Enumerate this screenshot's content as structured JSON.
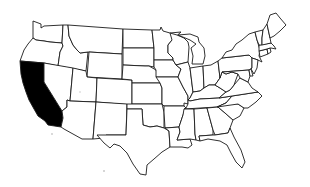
{
  "map": {
    "title": "United States",
    "highlighted_state": "California",
    "highlight_color": "#000000",
    "fill_color": "#ffffff",
    "stroke_color": "#1a1a1a",
    "states": [
      {
        "name": "Washington",
        "highlighted": false
      },
      {
        "name": "Oregon",
        "highlighted": false
      },
      {
        "name": "California",
        "highlighted": true
      },
      {
        "name": "Idaho",
        "highlighted": false
      },
      {
        "name": "Nevada",
        "highlighted": false
      },
      {
        "name": "Montana",
        "highlighted": false
      },
      {
        "name": "Wyoming",
        "highlighted": false
      },
      {
        "name": "Utah",
        "highlighted": false
      },
      {
        "name": "Arizona",
        "highlighted": false
      },
      {
        "name": "Colorado",
        "highlighted": false
      },
      {
        "name": "New Mexico",
        "highlighted": false
      },
      {
        "name": "North Dakota",
        "highlighted": false
      },
      {
        "name": "South Dakota",
        "highlighted": false
      },
      {
        "name": "Nebraska",
        "highlighted": false
      },
      {
        "name": "Kansas",
        "highlighted": false
      },
      {
        "name": "Oklahoma",
        "highlighted": false
      },
      {
        "name": "Texas",
        "highlighted": false
      },
      {
        "name": "Minnesota",
        "highlighted": false
      },
      {
        "name": "Iowa",
        "highlighted": false
      },
      {
        "name": "Missouri",
        "highlighted": false
      },
      {
        "name": "Arkansas",
        "highlighted": false
      },
      {
        "name": "Louisiana",
        "highlighted": false
      },
      {
        "name": "Wisconsin",
        "highlighted": false
      },
      {
        "name": "Illinois",
        "highlighted": false
      },
      {
        "name": "Michigan",
        "highlighted": false
      },
      {
        "name": "Indiana",
        "highlighted": false
      },
      {
        "name": "Ohio",
        "highlighted": false
      },
      {
        "name": "Kentucky",
        "highlighted": false
      },
      {
        "name": "Tennessee",
        "highlighted": false
      },
      {
        "name": "Mississippi",
        "highlighted": false
      },
      {
        "name": "Alabama",
        "highlighted": false
      },
      {
        "name": "Georgia",
        "highlighted": false
      },
      {
        "name": "Florida",
        "highlighted": false
      },
      {
        "name": "South Carolina",
        "highlighted": false
      },
      {
        "name": "North Carolina",
        "highlighted": false
      },
      {
        "name": "Virginia",
        "highlighted": false
      },
      {
        "name": "West Virginia",
        "highlighted": false
      },
      {
        "name": "Pennsylvania",
        "highlighted": false
      },
      {
        "name": "New York",
        "highlighted": false
      },
      {
        "name": "Maryland",
        "highlighted": false
      },
      {
        "name": "Delaware",
        "highlighted": false
      },
      {
        "name": "New Jersey",
        "highlighted": false
      },
      {
        "name": "Connecticut",
        "highlighted": false
      },
      {
        "name": "Rhode Island",
        "highlighted": false
      },
      {
        "name": "Massachusetts",
        "highlighted": false
      },
      {
        "name": "Vermont",
        "highlighted": false
      },
      {
        "name": "New Hampshire",
        "highlighted": false
      },
      {
        "name": "Maine",
        "highlighted": false
      }
    ]
  }
}
